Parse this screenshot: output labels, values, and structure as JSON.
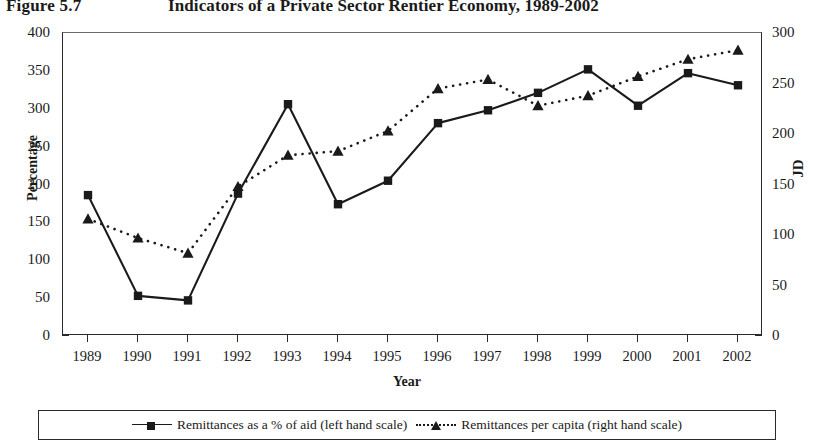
{
  "figure": {
    "number": "Figure 5.7",
    "title": "Indicators of a Private Sector Rentier Economy, 1989-2002"
  },
  "chart_data": {
    "type": "line",
    "title": "Indicators of a Private Sector Rentier Economy, 1989-2002",
    "xlabel": "Year",
    "ylabel": "Percentage",
    "y2label": "JD",
    "categories": [
      "1989",
      "1990",
      "1991",
      "1992",
      "1993",
      "1994",
      "1995",
      "1996",
      "1997",
      "1998",
      "1999",
      "2000",
      "2001",
      "2002"
    ],
    "ylim": [
      0,
      400
    ],
    "yticks": [
      0,
      50,
      100,
      150,
      200,
      250,
      300,
      350,
      400
    ],
    "y2lim": [
      0,
      300
    ],
    "y2ticks": [
      0,
      50,
      100,
      150,
      200,
      250,
      300
    ],
    "grid": false,
    "legend_position": "bottom",
    "series": [
      {
        "name": "Remittances as a % of aid (left hand scale)",
        "axis": "left",
        "marker": "square",
        "line_style": "solid",
        "color": "#1a1a1a",
        "values": [
          186,
          53,
          47,
          188,
          306,
          174,
          205,
          281,
          298,
          321,
          352,
          304,
          347,
          331
        ]
      },
      {
        "name": "Remittances per capita (right hand scale)",
        "axis": "right",
        "marker": "triangle",
        "line_style": "dotted",
        "color": "#1a1a1a",
        "values": [
          116,
          97,
          82,
          148,
          179,
          183,
          203,
          245,
          254,
          228,
          238,
          257,
          274,
          283
        ]
      }
    ]
  },
  "legend": {
    "series1_label": "Remittances as a % of aid (left hand scale)",
    "series2_label": "Remittances per capita (right hand scale)"
  }
}
